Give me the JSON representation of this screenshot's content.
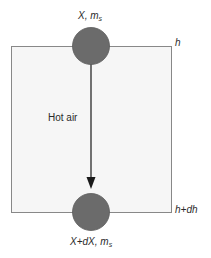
{
  "diagram": {
    "type": "drying-column-element",
    "colors": {
      "box_fill": "#f6f6f6",
      "box_stroke": "#888888",
      "particle_fill": "#6b6b6b",
      "particle_stroke": "#555555",
      "arrow": "#1a1a1a",
      "text": "#2a2a2a"
    },
    "top_particle": {
      "label_main": "X, m",
      "label_sub": "s"
    },
    "bottom_particle": {
      "label_main": "X+dX, m",
      "label_sub": "s"
    },
    "flow_label": "Hot air",
    "height_top_label": "h",
    "height_bottom_label": "h+dh"
  }
}
